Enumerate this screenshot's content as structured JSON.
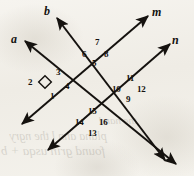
{
  "figure": {
    "kind": "geometry-diagram",
    "canvas": {
      "width": 194,
      "height": 176
    },
    "ink_color": "#15120f",
    "paper_color": "#f3f1ec",
    "stroke_width": 2.0,
    "lines": [
      {
        "name": "line-a",
        "label": "a",
        "label_x": 11,
        "label_y": 33,
        "x1": 25,
        "y1": 41,
        "x2": 176,
        "y2": 164,
        "arrow_start": true,
        "arrow_end": true
      },
      {
        "name": "line-b",
        "label": "b",
        "label_x": 44,
        "label_y": 5,
        "x1": 57,
        "y1": 18,
        "x2": 165,
        "y2": 160,
        "arrow_start": true,
        "arrow_end": true
      },
      {
        "name": "line-m",
        "label": "m",
        "label_x": 152,
        "label_y": 6,
        "x1": 148,
        "y1": 16,
        "x2": 22,
        "y2": 124,
        "arrow_start": true,
        "arrow_end": true
      },
      {
        "name": "line-n",
        "label": "n",
        "label_x": 172,
        "label_y": 34,
        "x1": 170,
        "y1": 44,
        "x2": 48,
        "y2": 150,
        "arrow_start": true,
        "arrow_end": true
      }
    ],
    "intersections": [
      {
        "name": "intersection-left",
        "lines": [
          "a",
          "m"
        ],
        "x": 56,
        "y": 82,
        "right_angle_mark": true,
        "right_angle_x": 45,
        "right_angle_y": 82,
        "right_angle_size": 9
      },
      {
        "name": "intersection-top",
        "lines": [
          "b",
          "m"
        ],
        "x": 97,
        "y": 48,
        "right_angle_mark": false
      },
      {
        "name": "intersection-right",
        "lines": [
          "b",
          "n"
        ],
        "x": 131,
        "y": 85,
        "right_angle_mark": false
      },
      {
        "name": "intersection-bottom",
        "lines": [
          "a",
          "n"
        ],
        "x": 92,
        "y": 119,
        "right_angle_mark": false
      }
    ],
    "angle_labels": [
      {
        "id": "angle-1",
        "text": "1",
        "x": 50,
        "y": 92,
        "at": "intersection-left",
        "position": "below"
      },
      {
        "id": "angle-2",
        "text": "2",
        "x": 28,
        "y": 78,
        "at": "intersection-left",
        "position": "left"
      },
      {
        "id": "angle-3",
        "text": "3",
        "x": 56,
        "y": 68,
        "at": "intersection-left",
        "position": "above"
      },
      {
        "id": "angle-4",
        "text": "4",
        "x": 65,
        "y": 82,
        "at": "intersection-left",
        "position": "right"
      },
      {
        "id": "angle-5",
        "text": "5",
        "x": 92,
        "y": 59,
        "at": "intersection-top",
        "position": "below"
      },
      {
        "id": "angle-6",
        "text": "6",
        "x": 82,
        "y": 50,
        "at": "intersection-top",
        "position": "left"
      },
      {
        "id": "angle-7",
        "text": "7",
        "x": 95,
        "y": 38,
        "at": "intersection-top",
        "position": "above"
      },
      {
        "id": "angle-8",
        "text": "8",
        "x": 104,
        "y": 50,
        "at": "intersection-top",
        "position": "right"
      },
      {
        "id": "angle-9",
        "text": "9",
        "x": 126,
        "y": 95,
        "at": "intersection-right",
        "position": "below"
      },
      {
        "id": "angle-10",
        "text": "10",
        "x": 112,
        "y": 85,
        "at": "intersection-right",
        "position": "left"
      },
      {
        "id": "angle-11",
        "text": "11",
        "x": 126,
        "y": 74,
        "at": "intersection-right",
        "position": "above"
      },
      {
        "id": "angle-12",
        "text": "12",
        "x": 137,
        "y": 85,
        "at": "intersection-right",
        "position": "right"
      },
      {
        "id": "angle-13",
        "text": "13",
        "x": 88,
        "y": 129,
        "at": "intersection-bottom",
        "position": "below"
      },
      {
        "id": "angle-14",
        "text": "14",
        "x": 75,
        "y": 118,
        "at": "intersection-bottom",
        "position": "left"
      },
      {
        "id": "angle-15",
        "text": "15",
        "x": 88,
        "y": 107,
        "at": "intersection-bottom",
        "position": "above"
      },
      {
        "id": "angle-16",
        "text": "16",
        "x": 99,
        "y": 118,
        "at": "intersection-bottom",
        "position": "right"
      }
    ],
    "bleed_through_text": [
      {
        "text": "the hand",
        "x": 118,
        "y": 124,
        "size": 11
      },
      {
        "text": "plana  ann l the  ngry",
        "x": 58,
        "y": 140,
        "size": 12
      },
      {
        "text": "found  grin  usqa + b u s",
        "x": 44,
        "y": 155,
        "size": 13
      }
    ]
  }
}
